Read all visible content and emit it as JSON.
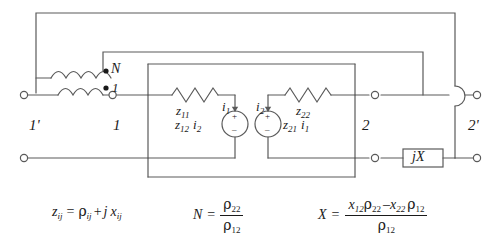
{
  "diagram": {
    "type": "electrical-schematic",
    "stroke_color": "#5a5a5a",
    "text_color": "#1a1a1a",
    "background": "#ffffff"
  },
  "ports": {
    "left_outer": "1'",
    "left_inner": "1",
    "right_inner": "2",
    "right_outer": "2'"
  },
  "transformer": {
    "turns_label": "N",
    "primary_dot_label": "1",
    "coils": 2,
    "polarity_dots": 2
  },
  "elements": {
    "z11": {
      "symbol": "z",
      "sub": "11",
      "kind": "impedance-zigzag"
    },
    "z22": {
      "symbol": "z",
      "sub": "22",
      "kind": "impedance-zigzag"
    },
    "source_left": {
      "expr_symbol": "z",
      "expr_sub": "12",
      "cur_symbol": "i",
      "cur_sub": "2",
      "plus": "+",
      "minus": "–"
    },
    "source_right": {
      "expr_symbol": "z",
      "expr_sub": "21",
      "cur_symbol": "i",
      "cur_sub": "1",
      "plus": "+",
      "minus": "–"
    },
    "current_left": {
      "symbol": "i",
      "sub": "1"
    },
    "current_right": {
      "symbol": "i",
      "sub": "2"
    },
    "reactance_box": {
      "label_j": "j",
      "label_x": "X"
    }
  },
  "equations": {
    "eq1": {
      "lhs_sym": "z",
      "lhs_sub": "ij",
      "eq": "=",
      "rho": "ρ",
      "rho_sub": "ij",
      "plus": "+",
      "j": "j",
      "x": "x",
      "x_sub": "ij"
    },
    "eq2": {
      "lhs": "N",
      "eq": "=",
      "num_rho": "ρ",
      "num_sub": "22",
      "den_rho": "ρ",
      "den_sub": "12"
    },
    "eq3": {
      "lhs": "X",
      "eq": "=",
      "num_x1": "x",
      "num_x1_sub": "12",
      "num_rho1": "ρ",
      "num_rho1_sub": "22",
      "minus": "–",
      "num_x2": "x",
      "num_x2_sub": "22",
      "num_rho2": "ρ",
      "num_rho2_sub": "12",
      "den_rho": "ρ",
      "den_sub": "12"
    }
  }
}
